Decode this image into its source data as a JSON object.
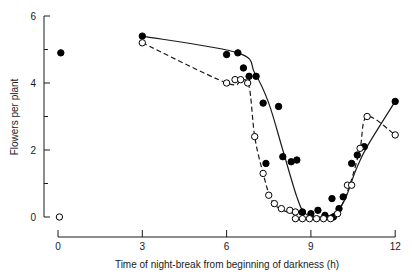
{
  "chart_data": {
    "type": "line",
    "title": "",
    "xlabel": "Time of night-break from beginning of darkness (h)",
    "ylabel": "Flowers per plant",
    "xlim": [
      0,
      12
    ],
    "ylim": [
      0,
      6
    ],
    "x_ticks": [
      0,
      3,
      6,
      9,
      12
    ],
    "x_tick_labels": [
      "0",
      "3",
      "6",
      "9",
      "12"
    ],
    "y_ticks": [
      0,
      2,
      4,
      6
    ],
    "y_tick_labels": [
      "0",
      "2",
      "4",
      "6"
    ],
    "y_minor_ticks": [
      1,
      3,
      5
    ],
    "grid": false,
    "legend": null,
    "series": [
      {
        "name": "filled circles (solid curve)",
        "marker": "filled-circle",
        "line_style": "solid",
        "points": [
          [
            0.1,
            4.9
          ],
          [
            3.0,
            5.4
          ],
          [
            6.0,
            4.85
          ],
          [
            6.4,
            4.9
          ],
          [
            6.6,
            4.45
          ],
          [
            6.8,
            4.2
          ],
          [
            7.05,
            4.2
          ],
          [
            7.3,
            3.4
          ],
          [
            7.4,
            1.6
          ],
          [
            7.85,
            3.3
          ],
          [
            8.0,
            1.8
          ],
          [
            8.3,
            1.65
          ],
          [
            8.5,
            1.7
          ],
          [
            8.7,
            0.15
          ],
          [
            9.0,
            0.1
          ],
          [
            9.25,
            0.2
          ],
          [
            9.5,
            0.05
          ],
          [
            9.8,
            0.0
          ],
          [
            9.75,
            0.55
          ],
          [
            10.0,
            0.25
          ],
          [
            10.15,
            0.6
          ],
          [
            10.45,
            1.6
          ],
          [
            10.65,
            1.85
          ],
          [
            10.9,
            2.1
          ],
          [
            12.0,
            3.45
          ]
        ],
        "curve": [
          [
            3.0,
            5.4
          ],
          [
            6.4,
            4.9
          ],
          [
            7.0,
            4.3
          ],
          [
            7.5,
            3.4
          ],
          [
            8.0,
            2.0
          ],
          [
            8.5,
            0.6
          ],
          [
            8.8,
            0.1
          ],
          [
            9.3,
            0.0
          ],
          [
            9.8,
            0.1
          ],
          [
            10.2,
            0.5
          ],
          [
            10.6,
            1.4
          ],
          [
            11.0,
            2.1
          ],
          [
            12.0,
            3.45
          ]
        ]
      },
      {
        "name": "open circles (dashed curve)",
        "marker": "open-circle",
        "line_style": "dashed",
        "points": [
          [
            0.05,
            0.0
          ],
          [
            3.0,
            5.2
          ],
          [
            6.0,
            4.0
          ],
          [
            6.3,
            4.1
          ],
          [
            6.5,
            4.1
          ],
          [
            6.75,
            4.0
          ],
          [
            7.0,
            2.4
          ],
          [
            7.3,
            1.3
          ],
          [
            7.5,
            0.65
          ],
          [
            7.7,
            0.4
          ],
          [
            7.95,
            0.25
          ],
          [
            8.25,
            0.2
          ],
          [
            8.45,
            0.15
          ],
          [
            8.45,
            -0.05
          ],
          [
            8.7,
            -0.05
          ],
          [
            8.95,
            -0.05
          ],
          [
            9.2,
            -0.05
          ],
          [
            9.45,
            -0.05
          ],
          [
            9.7,
            -0.05
          ],
          [
            9.95,
            0.1
          ],
          [
            10.3,
            0.95
          ],
          [
            10.45,
            0.95
          ],
          [
            10.75,
            2.05
          ],
          [
            11.0,
            3.0
          ],
          [
            12.0,
            2.45
          ]
        ],
        "curve": [
          [
            3.0,
            5.2
          ],
          [
            6.0,
            4.0
          ],
          [
            6.5,
            4.1
          ],
          [
            6.8,
            3.9
          ],
          [
            7.0,
            2.4
          ],
          [
            7.3,
            1.3
          ],
          [
            7.6,
            0.5
          ],
          [
            8.0,
            0.2
          ],
          [
            8.5,
            0.1
          ],
          [
            9.0,
            0.0
          ],
          [
            9.6,
            0.0
          ],
          [
            10.0,
            0.2
          ],
          [
            10.4,
            1.0
          ],
          [
            10.75,
            2.05
          ],
          [
            11.0,
            3.0
          ],
          [
            12.0,
            2.45
          ]
        ]
      }
    ],
    "annotations": [
      "one half-filled circle near (7.85 h, 3.3)"
    ]
  },
  "layout": {
    "axis_color": "#1a1a1a",
    "marker_color": "#000000"
  }
}
